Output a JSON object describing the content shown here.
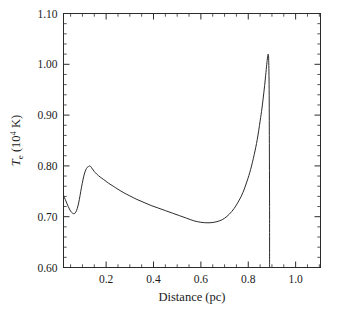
{
  "chart_data": {
    "type": "line",
    "title": "",
    "xlabel": "Distance (pc)",
    "ylabel": "T_e (10^4 K)",
    "ylabel_parts": {
      "symbol": "T",
      "subscript": "e",
      "units_open": "(10",
      "exponent": "4",
      "units_close": " K)"
    },
    "xlim": [
      0.02,
      1.105
    ],
    "ylim": [
      0.6,
      1.1
    ],
    "grid": false,
    "legend": null,
    "line_color": "#2b2b2b",
    "xticks_major": [
      0.2,
      0.4,
      0.6,
      0.8,
      1.0
    ],
    "xticklabels": [
      "0.2",
      "0.4",
      "0.6",
      "0.8",
      "1.0"
    ],
    "xtick_minor_step": 0.05,
    "yticks_major": [
      0.6,
      0.7,
      0.8,
      0.9,
      1.0,
      1.1
    ],
    "yticklabels": [
      "0.60",
      "0.70",
      "0.80",
      "0.90",
      "1.00",
      "1.10"
    ],
    "ytick_minor_step": 0.02,
    "annotations": [],
    "series": [
      {
        "name": "electron temperature profile",
        "x": [
          0.02,
          0.03,
          0.04,
          0.05,
          0.058,
          0.065,
          0.072,
          0.078,
          0.084,
          0.09,
          0.096,
          0.102,
          0.108,
          0.114,
          0.12,
          0.126,
          0.131,
          0.136,
          0.142,
          0.15,
          0.16,
          0.175,
          0.19,
          0.21,
          0.23,
          0.25,
          0.275,
          0.3,
          0.33,
          0.36,
          0.39,
          0.42,
          0.45,
          0.48,
          0.51,
          0.54,
          0.57,
          0.6,
          0.63,
          0.655,
          0.68,
          0.7,
          0.72,
          0.74,
          0.76,
          0.778,
          0.795,
          0.81,
          0.825,
          0.838,
          0.85,
          0.858,
          0.866,
          0.872,
          0.877,
          0.88,
          0.882,
          0.884,
          0.886,
          0.888,
          0.889,
          0.89,
          0.89
        ],
        "y": [
          0.742,
          0.731,
          0.72,
          0.711,
          0.707,
          0.706,
          0.709,
          0.716,
          0.727,
          0.742,
          0.758,
          0.772,
          0.784,
          0.792,
          0.797,
          0.799,
          0.8,
          0.798,
          0.794,
          0.789,
          0.784,
          0.778,
          0.773,
          0.766,
          0.76,
          0.754,
          0.747,
          0.741,
          0.734,
          0.728,
          0.722,
          0.717,
          0.712,
          0.707,
          0.702,
          0.697,
          0.692,
          0.689,
          0.688,
          0.689,
          0.692,
          0.697,
          0.705,
          0.716,
          0.731,
          0.748,
          0.77,
          0.793,
          0.822,
          0.852,
          0.888,
          0.914,
          0.945,
          0.971,
          0.995,
          1.008,
          1.016,
          1.02,
          1.012,
          0.96,
          0.86,
          0.72,
          0.602
        ]
      }
    ]
  }
}
